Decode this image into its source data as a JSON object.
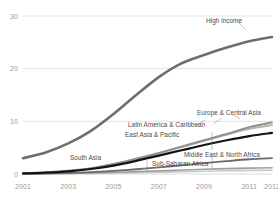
{
  "chart_data": {
    "type": "line",
    "title": "",
    "subtitle": "",
    "xlabel": "",
    "ylabel": "",
    "xlim": [
      2001,
      2012
    ],
    "ylim": [
      0,
      30
    ],
    "yticks": [
      0,
      10,
      20,
      30
    ],
    "ytick_labels": [
      "0",
      "10",
      "20",
      "30"
    ],
    "xticks": [
      2001,
      2003,
      2005,
      2007,
      2009,
      2011,
      2012
    ],
    "xtick_labels": [
      "2001",
      "2003",
      "2005",
      "2007",
      "2009",
      "2011",
      "2012"
    ],
    "grid": "horizontal",
    "legend_position": "inline-labels",
    "x": [
      2001,
      2002,
      2003,
      2004,
      2005,
      2006,
      2007,
      2008,
      2009,
      2010,
      2011,
      2012
    ],
    "series": [
      {
        "name": "High income",
        "color": "#6e6e6e",
        "width": 2.6,
        "values": [
          3.0,
          4.1,
          5.8,
          8.2,
          11.4,
          15.0,
          18.4,
          21.0,
          22.6,
          24.0,
          25.2,
          26.0
        ]
      },
      {
        "name": "Europe & Central Asia",
        "color": "#8f8f8f",
        "width": 2.0,
        "values": [
          0.15,
          0.3,
          0.6,
          1.1,
          1.9,
          2.9,
          4.0,
          5.2,
          6.4,
          7.6,
          8.9,
          9.8
        ]
      },
      {
        "name": "Latin America & Caribbean",
        "color": "#b5b5b5",
        "width": 2.0,
        "values": [
          0.12,
          0.28,
          0.55,
          1.0,
          1.8,
          2.8,
          3.9,
          5.1,
          6.3,
          7.5,
          8.6,
          9.3
        ]
      },
      {
        "name": "East Asia & Pacific",
        "color": "#141414",
        "width": 2.2,
        "values": [
          0.1,
          0.25,
          0.5,
          0.95,
          1.6,
          2.5,
          3.5,
          4.5,
          5.5,
          6.4,
          7.2,
          7.8
        ]
      },
      {
        "name": "Middle East & North Africa",
        "color": "#6a6a6a",
        "width": 1.8,
        "values": [
          0.05,
          0.1,
          0.2,
          0.35,
          0.6,
          0.9,
          1.25,
          1.65,
          2.05,
          2.45,
          2.8,
          3.0
        ]
      },
      {
        "name": "Sub-Saharan Africa",
        "color": "#9e9e9e",
        "width": 1.6,
        "values": [
          0.03,
          0.06,
          0.12,
          0.2,
          0.32,
          0.45,
          0.6,
          0.75,
          0.9,
          1.02,
          1.12,
          1.2
        ]
      },
      {
        "name": "South Asia",
        "color": "#c8c8c8",
        "width": 1.6,
        "values": [
          0.02,
          0.04,
          0.07,
          0.12,
          0.18,
          0.26,
          0.35,
          0.44,
          0.53,
          0.61,
          0.67,
          0.72
        ]
      }
    ],
    "annotations": [
      {
        "text": "High income",
        "x": 206,
        "y": 18
      },
      {
        "text": "Europe & Central Asia",
        "x": 197,
        "y": 110
      },
      {
        "text": "Latin America & Caribbean",
        "x": 128,
        "y": 122
      },
      {
        "text": "East Asia & Pacific",
        "x": 125,
        "y": 132
      },
      {
        "text": "South Asia",
        "x": 70,
        "y": 155
      },
      {
        "text": "Middle East & North Africa",
        "x": 184,
        "y": 152
      },
      {
        "text": "Sub-Saharan Africa",
        "x": 152,
        "y": 161
      }
    ]
  },
  "axes": {
    "y_labels": [
      "30",
      "20",
      "10",
      "0"
    ],
    "x_labels": [
      "2001",
      "2003",
      "2005",
      "2007",
      "2009",
      "2011",
      "2012"
    ]
  },
  "colors": {
    "background": "#ffffff",
    "gridline": "#d8d8d8",
    "axis_text": "#9a9a9a",
    "label_text": "#4a4a4a",
    "leader_line": "#808080"
  }
}
